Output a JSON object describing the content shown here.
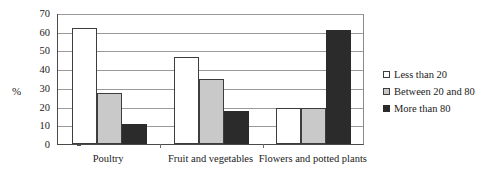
{
  "chart_data": {
    "type": "bar",
    "title": "",
    "xlabel": "",
    "ylabel": "%",
    "ylim": [
      0,
      70
    ],
    "yticks": [
      0,
      10,
      20,
      30,
      40,
      50,
      60,
      70
    ],
    "ytick_labels": [
      "0",
      "10",
      "20",
      "30",
      "40",
      "50",
      "60",
      "70"
    ],
    "grid": true,
    "legend_position": "right",
    "categories": [
      "Poultry",
      "Fruit and vegetables",
      "Flowers and  potted plants"
    ],
    "series": [
      {
        "name": "Less than 20",
        "color": "#ffffff",
        "values": [
          62,
          46.5,
          19.5
        ]
      },
      {
        "name": "Between 20 and 80",
        "color": "#c9c9c9",
        "values": [
          27,
          34.5,
          19.5
        ]
      },
      {
        "name": "More than 80",
        "color": "#2b2b2b",
        "values": [
          10.8,
          17.5,
          60.8
        ]
      }
    ]
  },
  "legend": {
    "items": [
      {
        "label": "Less than 20"
      },
      {
        "label": "Between 20 and 80"
      },
      {
        "label": "More than 80"
      }
    ]
  }
}
